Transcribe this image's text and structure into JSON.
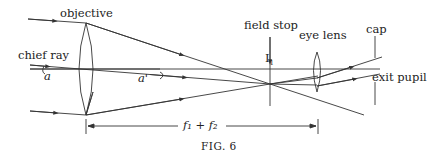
{
  "figure": {
    "caption": "FIG. 6",
    "labels": {
      "objective": "objective",
      "chief_ray": "chief ray",
      "angle_in": "a",
      "angle_out": "a'",
      "field_stop": "field stop",
      "image_point": "I",
      "image_subscript": "1",
      "eye_lens": "eye lens",
      "cap": "cap",
      "exit_pupil": "exit pupil",
      "distance": "f₁ + f₂"
    },
    "stroke_color": "#333333"
  }
}
